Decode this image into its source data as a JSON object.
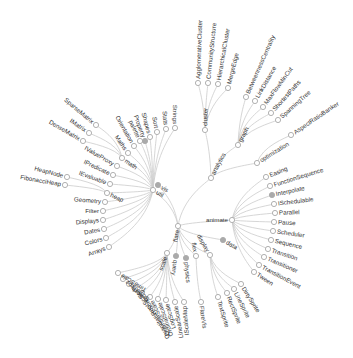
{
  "diagram": {
    "type": "radial-tree",
    "colors": {
      "link": "#cccccc",
      "node_stroke": "#a9a9a9",
      "node_fill_leaf": "#ffffff",
      "node_fill_collapsed": "#aaaaaa",
      "text": "#333333",
      "background": "#ffffff"
    },
    "root": {
      "name": "flare",
      "x": 178,
      "y": 226,
      "label_angle": -80,
      "label_dx": -3
    },
    "nodes": [
      {
        "id": "analytics",
        "name": "analytics",
        "parent": "root",
        "x": 211,
        "y": 178,
        "filled": false,
        "angle": -62,
        "side": "right",
        "inner": true
      },
      {
        "id": "cluster",
        "name": "cluster",
        "parent": "analytics",
        "x": 205,
        "y": 130,
        "filled": false,
        "angle": -88,
        "side": "right",
        "inner": true
      },
      {
        "id": "c1",
        "name": "AgglomerativeCluster",
        "parent": "cluster",
        "x": 198,
        "y": 83,
        "filled": false,
        "angle": -88,
        "side": "right"
      },
      {
        "id": "c2",
        "name": "CommunityStructure",
        "parent": "cluster",
        "x": 208,
        "y": 83,
        "filled": false,
        "angle": -84,
        "side": "right"
      },
      {
        "id": "c3",
        "name": "HierarchicalCluster",
        "parent": "cluster",
        "x": 218,
        "y": 84,
        "filled": false,
        "angle": -80,
        "side": "right"
      },
      {
        "id": "c4",
        "name": "MergeEdge",
        "parent": "cluster",
        "x": 228,
        "y": 88,
        "filled": false,
        "angle": -76,
        "side": "right"
      },
      {
        "id": "graph",
        "name": "graph",
        "parent": "analytics",
        "x": 238,
        "y": 145,
        "filled": false,
        "angle": -62,
        "side": "right",
        "inner": true
      },
      {
        "id": "g1",
        "name": "BetweennessCentrality",
        "parent": "graph",
        "x": 246,
        "y": 97,
        "filled": false,
        "angle": -66,
        "side": "right"
      },
      {
        "id": "g2",
        "name": "LinkDistance",
        "parent": "graph",
        "x": 255,
        "y": 101,
        "filled": false,
        "angle": -60,
        "side": "right"
      },
      {
        "id": "g3",
        "name": "MaxFlowMinCut",
        "parent": "graph",
        "x": 263,
        "y": 107,
        "filled": false,
        "angle": -54,
        "side": "right"
      },
      {
        "id": "g4",
        "name": "ShortestPaths",
        "parent": "graph",
        "x": 271,
        "y": 113,
        "filled": false,
        "angle": -48,
        "side": "right"
      },
      {
        "id": "g5",
        "name": "SpanningTree",
        "parent": "graph",
        "x": 278,
        "y": 120,
        "filled": false,
        "angle": -42,
        "side": "right"
      },
      {
        "id": "optimization",
        "name": "optimization",
        "parent": "analytics",
        "x": 257,
        "y": 163,
        "filled": false,
        "angle": -32,
        "side": "right",
        "inner": true
      },
      {
        "id": "o1",
        "name": "AspectRatioBanker",
        "parent": "optimization",
        "x": 291,
        "y": 135,
        "filled": false,
        "angle": -34,
        "side": "right"
      },
      {
        "id": "animate",
        "name": "animate",
        "parent": "root",
        "x": 232,
        "y": 220,
        "filled": false,
        "angle": 0,
        "side": "left",
        "inner": true
      },
      {
        "id": "a1",
        "name": "Easing",
        "parent": "animate",
        "x": 266,
        "y": 177,
        "filled": false,
        "angle": -22,
        "side": "right"
      },
      {
        "id": "a2",
        "name": "FunctionSequence",
        "parent": "animate",
        "x": 270,
        "y": 186,
        "filled": false,
        "angle": -17,
        "side": "right"
      },
      {
        "id": "a3",
        "name": "Interpolate",
        "parent": "animate",
        "x": 272,
        "y": 195,
        "filled": true,
        "angle": -12,
        "side": "right"
      },
      {
        "id": "a4",
        "name": "ISchedulable",
        "parent": "animate",
        "x": 274,
        "y": 204,
        "filled": false,
        "angle": -7,
        "side": "right"
      },
      {
        "id": "a5",
        "name": "Parallel",
        "parent": "animate",
        "x": 275,
        "y": 213,
        "filled": false,
        "angle": -2,
        "side": "right"
      },
      {
        "id": "a6",
        "name": "Pause",
        "parent": "animate",
        "x": 274,
        "y": 222,
        "filled": false,
        "angle": 3,
        "side": "right"
      },
      {
        "id": "a7",
        "name": "Scheduler",
        "parent": "animate",
        "x": 273,
        "y": 231,
        "filled": false,
        "angle": 8,
        "side": "right"
      },
      {
        "id": "a8",
        "name": "Sequence",
        "parent": "animate",
        "x": 271,
        "y": 240,
        "filled": false,
        "angle": 13,
        "side": "right"
      },
      {
        "id": "a9",
        "name": "Transition",
        "parent": "animate",
        "x": 268,
        "y": 249,
        "filled": false,
        "angle": 18,
        "side": "right"
      },
      {
        "id": "a10",
        "name": "Transitioner",
        "parent": "animate",
        "x": 264,
        "y": 257,
        "filled": false,
        "angle": 23,
        "side": "right"
      },
      {
        "id": "a11",
        "name": "TransitionEvent",
        "parent": "animate",
        "x": 259,
        "y": 265,
        "filled": false,
        "angle": 28,
        "side": "right"
      },
      {
        "id": "a12",
        "name": "Tween",
        "parent": "animate",
        "x": 254,
        "y": 272,
        "filled": false,
        "angle": 33,
        "side": "right"
      },
      {
        "id": "data",
        "name": "data",
        "parent": "root",
        "x": 223,
        "y": 240,
        "filled": true,
        "angle": 30,
        "side": "right"
      },
      {
        "id": "display",
        "name": "display",
        "parent": "root",
        "x": 210,
        "y": 255,
        "filled": false,
        "angle": 60,
        "side": "left",
        "inner": true
      },
      {
        "id": "d1",
        "name": "DirtySprite",
        "parent": "display",
        "x": 241,
        "y": 284,
        "filled": false,
        "angle": 58,
        "side": "right"
      },
      {
        "id": "d2",
        "name": "LineSprite",
        "parent": "display",
        "x": 234,
        "y": 289,
        "filled": false,
        "angle": 63,
        "side": "right"
      },
      {
        "id": "d3",
        "name": "RectSprite",
        "parent": "display",
        "x": 227,
        "y": 293,
        "filled": false,
        "angle": 68,
        "side": "right"
      },
      {
        "id": "d4",
        "name": "TextSprite",
        "parent": "display",
        "x": 218,
        "y": 297,
        "filled": false,
        "angle": 73,
        "side": "right"
      },
      {
        "id": "flex",
        "name": "flex",
        "parent": "root",
        "x": 196,
        "y": 256,
        "filled": false,
        "angle": 80,
        "side": "left",
        "inner": true
      },
      {
        "id": "f1",
        "name": "FlareVis",
        "parent": "flex",
        "x": 201,
        "y": 302,
        "filled": false,
        "angle": 82,
        "side": "right"
      },
      {
        "id": "physics",
        "name": "physics",
        "parent": "root",
        "x": 186,
        "y": 258,
        "filled": true,
        "angle": 85,
        "side": "right"
      },
      {
        "id": "query",
        "name": "query",
        "parent": "root",
        "x": 176,
        "y": 256,
        "filled": true,
        "angle": 97,
        "side": "right"
      },
      {
        "id": "scale",
        "name": "scale",
        "parent": "root",
        "x": 167,
        "y": 253,
        "filled": false,
        "angle": -70,
        "side": "left",
        "inner": true
      },
      {
        "id": "s1",
        "name": "IScaleMap",
        "parent": "scale",
        "x": 184,
        "y": 302,
        "filled": false,
        "angle": -95,
        "side": "left"
      },
      {
        "id": "s2",
        "name": "LinearScale",
        "parent": "scale",
        "x": 175,
        "y": 302,
        "filled": false,
        "angle": -100,
        "side": "left"
      },
      {
        "id": "s3",
        "name": "LogScale",
        "parent": "scale",
        "x": 166,
        "y": 300,
        "filled": false,
        "angle": -105,
        "side": "left"
      },
      {
        "id": "s4",
        "name": "OrdinalScale",
        "parent": "scale",
        "x": 158,
        "y": 299,
        "filled": false,
        "angle": -110,
        "side": "left"
      },
      {
        "id": "s5",
        "name": "QuantileScale",
        "parent": "scale",
        "x": 150,
        "y": 297,
        "filled": false,
        "angle": -115,
        "side": "left"
      },
      {
        "id": "s6",
        "name": "QuantitativeScale",
        "parent": "scale",
        "x": 142,
        "y": 293,
        "filled": false,
        "angle": -120,
        "side": "left"
      },
      {
        "id": "s7",
        "name": "RootScale",
        "parent": "scale",
        "x": 135,
        "y": 289,
        "filled": false,
        "angle": -127,
        "side": "left"
      },
      {
        "id": "s8",
        "name": "Scale",
        "parent": "scale",
        "x": 129,
        "y": 284,
        "filled": false,
        "angle": -134,
        "side": "left"
      },
      {
        "id": "s9",
        "name": "ScaleType",
        "parent": "scale",
        "x": 123,
        "y": 279,
        "filled": false,
        "angle": -141,
        "side": "left"
      },
      {
        "id": "s10",
        "name": "TimeScale",
        "parent": "scale",
        "x": 118,
        "y": 273,
        "filled": false,
        "angle": -148,
        "side": "left"
      },
      {
        "id": "util",
        "name": "util",
        "parent": "root",
        "x": 153,
        "y": 190,
        "filled": false,
        "angle": 30,
        "side": "right",
        "inner": true
      },
      {
        "id": "vis",
        "name": "vis",
        "parent": "root",
        "x": 158,
        "y": 185,
        "filled": true,
        "angle": 30,
        "side": "right"
      },
      {
        "id": "u1",
        "name": "Arrays",
        "parent": "util",
        "x": 109,
        "y": 247,
        "filled": false,
        "angle": -20,
        "side": "left"
      },
      {
        "id": "u2",
        "name": "Colors",
        "parent": "util",
        "x": 106,
        "y": 238,
        "filled": false,
        "angle": -15,
        "side": "left"
      },
      {
        "id": "u3",
        "name": "Dates",
        "parent": "util",
        "x": 104,
        "y": 229,
        "filled": false,
        "angle": -10,
        "side": "left"
      },
      {
        "id": "u4",
        "name": "Displays",
        "parent": "util",
        "x": 103,
        "y": 220,
        "filled": false,
        "angle": -5,
        "side": "left"
      },
      {
        "id": "u5",
        "name": "Filter",
        "parent": "util",
        "x": 103,
        "y": 211,
        "filled": false,
        "angle": 0,
        "side": "left"
      },
      {
        "id": "u6",
        "name": "Geometry",
        "parent": "util",
        "x": 105,
        "y": 202,
        "filled": false,
        "angle": 5,
        "side": "left"
      },
      {
        "id": "heap",
        "name": "heap",
        "parent": "util",
        "x": 107,
        "y": 193,
        "filled": false,
        "angle": 25,
        "side": "right",
        "inner": true
      },
      {
        "id": "h1",
        "name": "FibonacciHeap",
        "parent": "heap",
        "x": 65,
        "y": 185,
        "filled": false,
        "angle": 10,
        "side": "left"
      },
      {
        "id": "h2",
        "name": "HeapNode",
        "parent": "heap",
        "x": 67,
        "y": 177,
        "filled": false,
        "angle": 15,
        "side": "left"
      },
      {
        "id": "u7",
        "name": "IEvaluable",
        "parent": "util",
        "x": 110,
        "y": 184,
        "filled": false,
        "angle": 20,
        "side": "left"
      },
      {
        "id": "u8",
        "name": "IPredicate",
        "parent": "util",
        "x": 113,
        "y": 175,
        "filled": false,
        "angle": 25,
        "side": "left"
      },
      {
        "id": "u9",
        "name": "IValueProxy",
        "parent": "util",
        "x": 117,
        "y": 166,
        "filled": false,
        "angle": 30,
        "side": "left"
      },
      {
        "id": "math",
        "name": "math",
        "parent": "util",
        "x": 122,
        "y": 158,
        "filled": false,
        "angle": 35,
        "side": "right",
        "inner": true
      },
      {
        "id": "m1",
        "name": "DenseMatrix",
        "parent": "math",
        "x": 83,
        "y": 141,
        "filled": false,
        "angle": 30,
        "side": "left"
      },
      {
        "id": "m2",
        "name": "IMatrix",
        "parent": "math",
        "x": 89,
        "y": 133,
        "filled": false,
        "angle": 35,
        "side": "left"
      },
      {
        "id": "m3",
        "name": "SparseMatrix",
        "parent": "math",
        "x": 96,
        "y": 125,
        "filled": false,
        "angle": 40,
        "side": "left"
      },
      {
        "id": "u10",
        "name": "Maths",
        "parent": "util",
        "x": 128,
        "y": 153,
        "filled": false,
        "angle": 55,
        "side": "left"
      },
      {
        "id": "u11",
        "name": "Orientation",
        "parent": "util",
        "x": 134,
        "y": 146,
        "filled": false,
        "angle": 60,
        "side": "left"
      },
      {
        "id": "palette",
        "name": "palette",
        "parent": "util",
        "x": 140,
        "y": 141,
        "filled": false,
        "angle": 65,
        "side": "left"
      },
      {
        "id": "u12",
        "name": "Property",
        "parent": "util",
        "x": 145,
        "y": 141,
        "filled": true,
        "angle": 70,
        "side": "left"
      },
      {
        "id": "u13",
        "name": "Shapes",
        "parent": "util",
        "x": 150,
        "y": 137,
        "filled": false,
        "angle": 75,
        "side": "left"
      },
      {
        "id": "u14",
        "name": "Sort",
        "parent": "util",
        "x": 157,
        "y": 132,
        "filled": false,
        "angle": 80,
        "side": "left"
      },
      {
        "id": "u15",
        "name": "Stats",
        "parent": "util",
        "x": 166,
        "y": 129,
        "filled": false,
        "angle": 85,
        "side": "left"
      },
      {
        "id": "u16",
        "name": "Strings",
        "parent": "util",
        "x": 175,
        "y": 128,
        "filled": false,
        "angle": 90,
        "side": "left"
      }
    ]
  }
}
